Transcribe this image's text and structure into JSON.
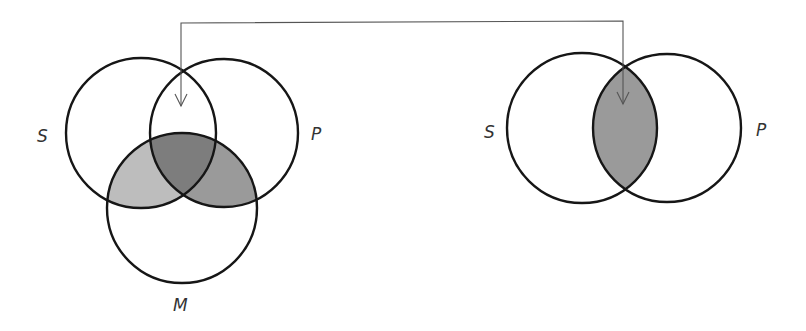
{
  "diagram": {
    "type": "venn-syllogism-reduction",
    "colors": {
      "background": "#ffffff",
      "stroke": "#161616",
      "shade_light": "#bdbdbd",
      "shade_medium": "#9a9a9a",
      "shade_dark": "#7d7d7d",
      "connector": "#555555"
    },
    "left": {
      "circles": [
        {
          "id": "S",
          "label": "S",
          "cx": 141,
          "cy": 133,
          "r": 75,
          "label_x": 37,
          "label_y": 142
        },
        {
          "id": "P",
          "label": "P",
          "cx": 224,
          "cy": 133,
          "r": 74,
          "label_x": 311,
          "label_y": 140
        },
        {
          "id": "M",
          "label": "M",
          "cx": 182,
          "cy": 208,
          "r": 75,
          "label_x": 173,
          "label_y": 311
        }
      ],
      "shaded_regions": [
        {
          "region": "S∩M only",
          "shade": "light"
        },
        {
          "region": "P∩M only",
          "shade": "medium"
        },
        {
          "region": "S∩P∩M",
          "shade": "dark"
        }
      ]
    },
    "right": {
      "circles": [
        {
          "id": "S",
          "label": "S",
          "cx": 582,
          "cy": 128,
          "r": 75,
          "label_x": 484,
          "label_y": 138
        },
        {
          "id": "P",
          "label": "P",
          "cx": 667,
          "cy": 128,
          "r": 74,
          "label_x": 756,
          "label_y": 136
        }
      ],
      "shaded_regions": [
        {
          "region": "S∩P",
          "shade": "medium"
        }
      ]
    },
    "connector": {
      "from": [
        181,
        23
      ],
      "corner_left": [
        181,
        23
      ],
      "corner_right": [
        623,
        21
      ],
      "left_arrow_tip": [
        181,
        106
      ],
      "right_arrow_tip": [
        623,
        104
      ]
    }
  }
}
